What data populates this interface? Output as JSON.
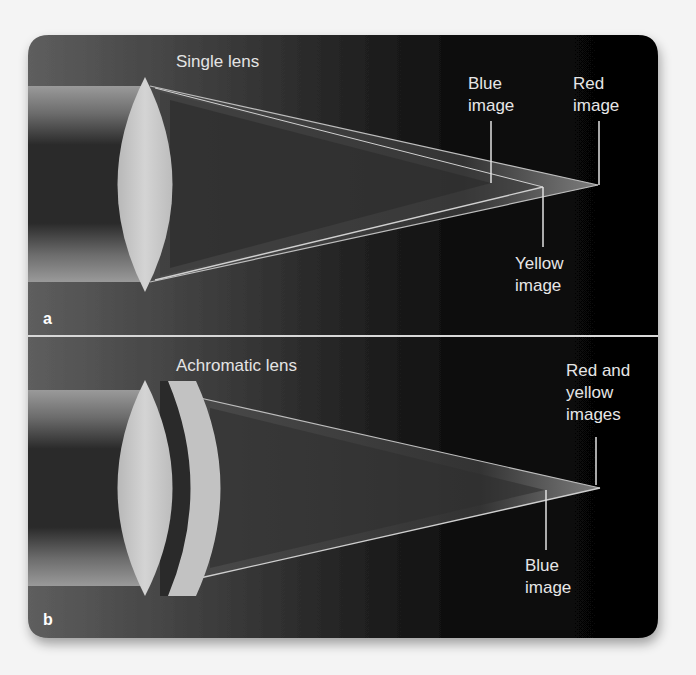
{
  "figure": {
    "panels": [
      {
        "letter": "a",
        "title": "Single lens",
        "labels": {
          "blue": [
            "Blue",
            "image"
          ],
          "red": [
            "Red",
            "image"
          ],
          "yellow": [
            "Yellow",
            "image"
          ]
        }
      },
      {
        "letter": "b",
        "title": "Achromatic lens",
        "labels": {
          "red_yellow": [
            "Red and",
            "yellow",
            "images"
          ],
          "blue": [
            "Blue",
            "image"
          ]
        }
      }
    ],
    "colors": {
      "page_background": "#f4f4f4",
      "panel_dark": "#050505",
      "panel_light": "#5a5a5a",
      "lens": "#c9c9c9",
      "divider": "#d8d8d8",
      "text": "#e6e6e6"
    }
  }
}
